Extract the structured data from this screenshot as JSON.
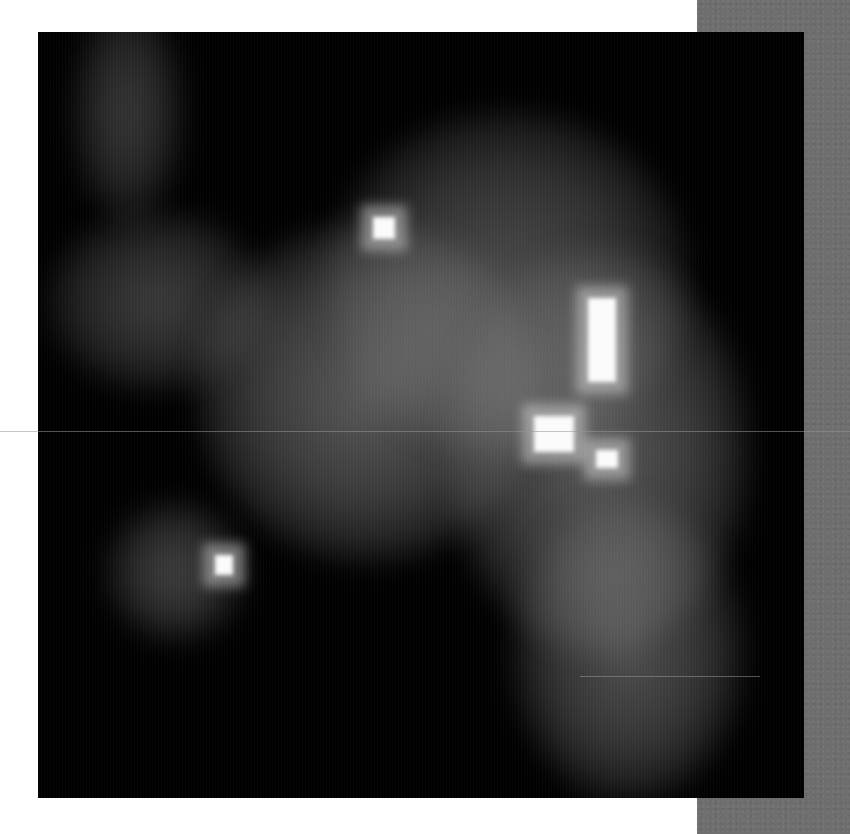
{
  "image": {
    "kind": "grayscale microscopy / fluorescence intensity map",
    "width": 850,
    "height": 834,
    "frame": {
      "x": 38,
      "y": 32,
      "size": 766,
      "background": "#000000"
    },
    "side_strip": {
      "x": 697,
      "color": "#6e6e6e"
    },
    "diffuse_regions": [
      {
        "name": "top-left-glow",
        "cx": 90,
        "cy": 80,
        "rx": 55,
        "ry": 110,
        "intensity": 0.28
      },
      {
        "name": "left-lobe",
        "cx": 120,
        "cy": 270,
        "rx": 110,
        "ry": 90,
        "intensity": 0.3
      },
      {
        "name": "central-mass",
        "cx": 330,
        "cy": 360,
        "rx": 170,
        "ry": 170,
        "intensity": 0.45
      },
      {
        "name": "upper-right-mass",
        "cx": 470,
        "cy": 250,
        "rx": 180,
        "ry": 170,
        "intensity": 0.38
      },
      {
        "name": "right-mass",
        "cx": 560,
        "cy": 420,
        "rx": 150,
        "ry": 200,
        "intensity": 0.45
      },
      {
        "name": "lower-right-mass",
        "cx": 590,
        "cy": 620,
        "rx": 115,
        "ry": 150,
        "intensity": 0.4
      },
      {
        "name": "lower-left-blob",
        "cx": 138,
        "cy": 540,
        "rx": 70,
        "ry": 70,
        "intensity": 0.32
      }
    ],
    "bright_spots": [
      {
        "name": "spot-upper-center",
        "x": 335,
        "y": 185,
        "w": 22,
        "h": 22
      },
      {
        "name": "spot-vertical-bar",
        "x": 550,
        "y": 266,
        "w": 28,
        "h": 84
      },
      {
        "name": "spot-right-center",
        "x": 496,
        "y": 384,
        "w": 40,
        "h": 36
      },
      {
        "name": "spot-right-small",
        "x": 558,
        "y": 418,
        "w": 22,
        "h": 18
      },
      {
        "name": "spot-lower-left",
        "x": 177,
        "y": 523,
        "w": 18,
        "h": 20
      }
    ],
    "scan_lines": [
      {
        "y": 431,
        "x1": 0,
        "x2": 850
      },
      {
        "y": 676,
        "x1": 580,
        "x2": 760
      }
    ]
  }
}
